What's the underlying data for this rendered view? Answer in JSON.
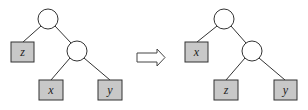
{
  "diagram": {
    "title": "",
    "colors": {
      "leaf_fill": "#c8c8c8",
      "stroke": "#333333",
      "background": "#ffffff"
    },
    "before_tree": {
      "root": {
        "type": "internal"
      },
      "left": {
        "type": "leaf",
        "label": "z"
      },
      "right": {
        "type": "internal",
        "left": {
          "type": "leaf",
          "label": "x"
        },
        "right": {
          "type": "leaf",
          "label": "y"
        }
      }
    },
    "transform_arrow": "⇒",
    "after_tree": {
      "root": {
        "type": "internal"
      },
      "left": {
        "type": "leaf",
        "label": "x"
      },
      "right": {
        "type": "internal",
        "left": {
          "type": "leaf",
          "label": "z"
        },
        "right": {
          "type": "leaf",
          "label": "y"
        }
      }
    }
  }
}
